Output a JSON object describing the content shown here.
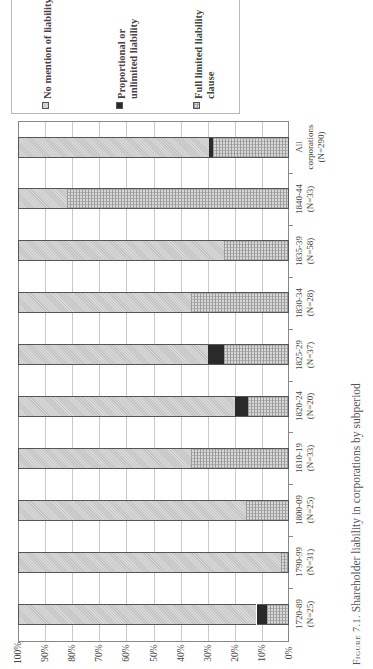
{
  "caption": {
    "figure_label": "Figure 7.1.",
    "text": "Shareholder liability in corporations by subperiod"
  },
  "legend": [
    {
      "label": "No mention of liability",
      "pattern": "light-grey-dither"
    },
    {
      "label": "Proportional or\nunlimited liability",
      "pattern": "solid-black"
    },
    {
      "label": "Full limited liability\nclause",
      "pattern": "grey-brick"
    }
  ],
  "axis": {
    "ticks": [
      "100%",
      "90%",
      "80%",
      "70%",
      "60%",
      "50%",
      "40%",
      "30%",
      "20%",
      "10%",
      "0%"
    ]
  },
  "categories_display": [
    {
      "period": "All",
      "n": "corporations\n(N=290)"
    },
    {
      "period": "1840-44",
      "n": "(N=33)"
    },
    {
      "period": "1835-39",
      "n": "(N=58)"
    },
    {
      "period": "1830-34",
      "n": "(N=28)"
    },
    {
      "period": "1825-29",
      "n": "(N=37)"
    },
    {
      "period": "1820-24",
      "n": "(N=20)"
    },
    {
      "period": "1810-19",
      "n": "(N=33)"
    },
    {
      "period": "1800-09",
      "n": "(N=25)"
    },
    {
      "period": "1790-99",
      "n": "(N=31)"
    },
    {
      "period": "1720-89",
      "n": "(N=25)"
    }
  ],
  "chart_data": {
    "type": "bar",
    "stacked": true,
    "orientation": "horizontal (rotated figure, 0% at right, 100% at left)",
    "title": "Shareholder liability in corporations by subperiod",
    "xlabel": "",
    "ylabel": "",
    "ylim": [
      0,
      100
    ],
    "grid": true,
    "legend_position": "top",
    "categories": [
      "1720-89 (N=25)",
      "1790-99 (N=31)",
      "1800-09 (N=25)",
      "1810-19 (N=33)",
      "1820-24 (N=20)",
      "1825-29 (N=37)",
      "1830-34 (N=28)",
      "1835-39 (N=58)",
      "1840-44 (N=33)",
      "All corporations (N=290)"
    ],
    "series": [
      {
        "name": "Full limited liability clause",
        "values": [
          8,
          3,
          16,
          36,
          15,
          24,
          36,
          24,
          82,
          28
        ]
      },
      {
        "name": "Proportional or unlimited liability",
        "values": [
          4,
          0,
          0,
          0,
          5,
          6,
          0,
          0,
          0,
          1.5
        ]
      },
      {
        "name": "No mention of liability",
        "values": [
          88,
          97,
          84,
          64,
          80,
          70,
          64,
          76,
          18,
          70.5
        ]
      }
    ]
  }
}
